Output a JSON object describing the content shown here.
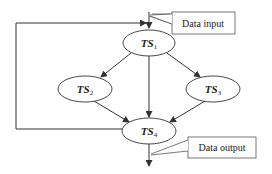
{
  "diagram": {
    "nodes": [
      {
        "id": "TS1",
        "base": "TS",
        "sub": "1",
        "cx": 149,
        "cy": 43
      },
      {
        "id": "TS2",
        "base": "TS",
        "sub": "2",
        "cx": 85,
        "cy": 89
      },
      {
        "id": "TS3",
        "base": "TS",
        "sub": "3",
        "cx": 213,
        "cy": 89
      },
      {
        "id": "TS4",
        "base": "TS",
        "sub": "4",
        "cx": 149,
        "cy": 131
      }
    ],
    "edges": [
      {
        "from": "TS1",
        "to": "TS2"
      },
      {
        "from": "TS1",
        "to": "TS3"
      },
      {
        "from": "TS1",
        "to": "TS4"
      },
      {
        "from": "TS2",
        "to": "TS4"
      },
      {
        "from": "TS3",
        "to": "TS4"
      },
      {
        "from": "TS4",
        "to": "output"
      },
      {
        "from": "output",
        "to": "TS1",
        "type": "feedback-loop"
      }
    ],
    "callouts": {
      "input": "Data input",
      "output": "Data output"
    },
    "colors": {
      "stroke": "#333333",
      "background": "#ffffff"
    }
  }
}
